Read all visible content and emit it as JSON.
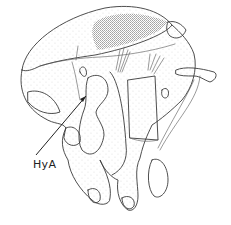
{
  "figure": {
    "type": "scientific line drawing",
    "labels": [
      {
        "text": "HyA",
        "arrow_target": "hypopharyngeal apodeme region"
      }
    ],
    "colors": {
      "ink": "#3a3a3a",
      "background": "#ffffff",
      "stipple": "#555555"
    }
  }
}
